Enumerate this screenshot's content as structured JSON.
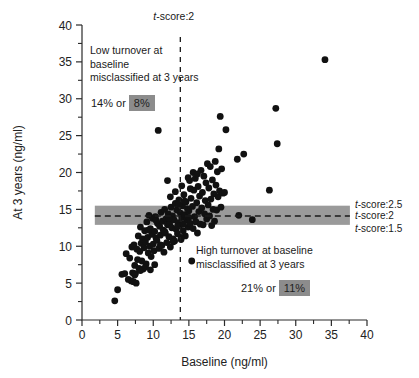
{
  "chart_data": {
    "type": "scatter",
    "title": "",
    "xlabel": "Baseline (ng/ml)",
    "ylabel": "At 3 years (ng/ml)",
    "xlim": [
      0,
      40
    ],
    "ylim": [
      0,
      40
    ],
    "xticks": [
      0,
      5,
      10,
      15,
      20,
      25,
      30,
      35,
      40
    ],
    "yticks": [
      0,
      5,
      10,
      15,
      20,
      25,
      30,
      35,
      40
    ],
    "xtick_labels": [
      "0",
      "5",
      "10",
      "15",
      "20",
      "25",
      "30",
      "35",
      "40"
    ],
    "ytick_labels": [
      "0",
      "5",
      "10",
      "15",
      "20",
      "25",
      "30",
      "35",
      "40"
    ],
    "minor_tick_step": 2.5,
    "grid": false,
    "legend": "none",
    "series": [
      {
        "name": "Bone turnover marker paired measurements",
        "marker": "circle",
        "color": "#111111",
        "points": [
          [
            4.6,
            2.6
          ],
          [
            5.0,
            4.1
          ],
          [
            5.6,
            6.2
          ],
          [
            6.0,
            6.3
          ],
          [
            6.2,
            9.0
          ],
          [
            6.5,
            5.5
          ],
          [
            6.7,
            8.4
          ],
          [
            6.9,
            5.3
          ],
          [
            7.0,
            9.9
          ],
          [
            7.1,
            6.4
          ],
          [
            7.2,
            5.2
          ],
          [
            7.3,
            10.2
          ],
          [
            7.4,
            7.4
          ],
          [
            7.5,
            6.3
          ],
          [
            7.6,
            5.0
          ],
          [
            7.7,
            9.6
          ],
          [
            7.8,
            8.2
          ],
          [
            7.9,
            11.4
          ],
          [
            8.0,
            7.0
          ],
          [
            8.1,
            9.3
          ],
          [
            8.2,
            12.6
          ],
          [
            8.3,
            10.4
          ],
          [
            8.4,
            8.0
          ],
          [
            8.5,
            11.0
          ],
          [
            8.6,
            6.9
          ],
          [
            8.7,
            9.8
          ],
          [
            8.8,
            12.1
          ],
          [
            8.9,
            10.6
          ],
          [
            9.0,
            7.6
          ],
          [
            9.1,
            13.3
          ],
          [
            9.2,
            11.2
          ],
          [
            9.3,
            9.1
          ],
          [
            9.4,
            14.2
          ],
          [
            9.5,
            10.0
          ],
          [
            9.6,
            12.4
          ],
          [
            9.7,
            8.6
          ],
          [
            9.8,
            11.6
          ],
          [
            9.9,
            13.8
          ],
          [
            10.0,
            10.3
          ],
          [
            10.1,
            9.4
          ],
          [
            10.2,
            12.0
          ],
          [
            10.3,
            14.0
          ],
          [
            10.4,
            11.1
          ],
          [
            10.5,
            10.8
          ],
          [
            10.6,
            13.1
          ],
          [
            10.7,
            25.7
          ],
          [
            10.8,
            9.7
          ],
          [
            10.9,
            12.7
          ],
          [
            11.0,
            11.5
          ],
          [
            11.1,
            14.6
          ],
          [
            11.2,
            10.1
          ],
          [
            11.3,
            13.4
          ],
          [
            11.4,
            12.2
          ],
          [
            11.5,
            9.2
          ],
          [
            11.6,
            15.0
          ],
          [
            11.7,
            11.8
          ],
          [
            11.8,
            13.7
          ],
          [
            11.9,
            10.5
          ],
          [
            12.0,
            12.9
          ],
          [
            12.1,
            14.4
          ],
          [
            12.2,
            11.3
          ],
          [
            12.3,
            13.0
          ],
          [
            12.4,
            9.9
          ],
          [
            12.5,
            15.3
          ],
          [
            12.6,
            12.5
          ],
          [
            12.7,
            14.1
          ],
          [
            12.8,
            11.0
          ],
          [
            12.9,
            13.6
          ],
          [
            13.0,
            10.7
          ],
          [
            13.1,
            15.8
          ],
          [
            13.2,
            12.3
          ],
          [
            13.3,
            14.9
          ],
          [
            13.4,
            11.7
          ],
          [
            13.5,
            13.2
          ],
          [
            13.6,
            16.3
          ],
          [
            13.7,
            12.8
          ],
          [
            13.8,
            14.5
          ],
          [
            13.9,
            10.9
          ],
          [
            14.0,
            13.9
          ],
          [
            14.1,
            15.5
          ],
          [
            14.2,
            12.1
          ],
          [
            14.3,
            17.0
          ],
          [
            14.4,
            14.3
          ],
          [
            14.5,
            11.4
          ],
          [
            14.6,
            16.0
          ],
          [
            14.7,
            13.5
          ],
          [
            14.8,
            15.1
          ],
          [
            14.9,
            12.6
          ],
          [
            15.0,
            14.8
          ],
          [
            15.1,
            18.9
          ],
          [
            15.2,
            13.1
          ],
          [
            15.3,
            16.5
          ],
          [
            15.4,
            8.0
          ],
          [
            15.5,
            15.4
          ],
          [
            15.6,
            12.4
          ],
          [
            15.7,
            17.6
          ],
          [
            15.8,
            14.0
          ],
          [
            15.9,
            19.2
          ],
          [
            16.0,
            13.3
          ],
          [
            16.1,
            15.9
          ],
          [
            16.2,
            11.8
          ],
          [
            16.3,
            18.1
          ],
          [
            16.4,
            14.7
          ],
          [
            16.5,
            16.8
          ],
          [
            16.6,
            13.0
          ],
          [
            16.7,
            20.3
          ],
          [
            16.8,
            15.2
          ],
          [
            16.9,
            17.3
          ],
          [
            17.0,
            12.9
          ],
          [
            17.1,
            19.5
          ],
          [
            17.2,
            14.4
          ],
          [
            17.3,
            16.2
          ],
          [
            17.4,
            18.6
          ],
          [
            17.5,
            13.7
          ],
          [
            17.6,
            21.2
          ],
          [
            17.7,
            15.6
          ],
          [
            17.8,
            17.9
          ],
          [
            17.9,
            14.1
          ],
          [
            18.0,
            20.8
          ],
          [
            18.1,
            16.4
          ],
          [
            18.2,
            12.8
          ],
          [
            18.3,
            19.0
          ],
          [
            18.4,
            15.0
          ],
          [
            18.5,
            17.1
          ],
          [
            18.6,
            13.4
          ],
          [
            18.7,
            21.5
          ],
          [
            18.8,
            18.3
          ],
          [
            18.9,
            14.9
          ],
          [
            19.0,
            20.1
          ],
          [
            19.1,
            16.7
          ],
          [
            19.2,
            23.2
          ],
          [
            19.3,
            17.5
          ],
          [
            19.4,
            27.6
          ],
          [
            19.5,
            15.3
          ],
          [
            19.6,
            20.5
          ],
          [
            19.8,
            17.2
          ],
          [
            20.0,
            17.3
          ],
          [
            20.2,
            25.8
          ],
          [
            21.8,
            21.8
          ],
          [
            22.0,
            14.2
          ],
          [
            22.7,
            22.5
          ],
          [
            23.9,
            13.6
          ],
          [
            26.3,
            17.6
          ],
          [
            27.2,
            28.7
          ],
          [
            27.4,
            23.9
          ],
          [
            34.1,
            35.3
          ],
          [
            9.3,
            12.2
          ],
          [
            10.4,
            13.5
          ],
          [
            11.6,
            12.0
          ],
          [
            12.2,
            13.8
          ],
          [
            13.4,
            12.7
          ],
          [
            14.2,
            13.0
          ],
          [
            15.0,
            13.9
          ],
          [
            11.0,
            10.2
          ],
          [
            12.8,
            10.6
          ],
          [
            13.9,
            11.2
          ],
          [
            8.2,
            6.7
          ],
          [
            8.9,
            7.2
          ],
          [
            9.6,
            6.8
          ],
          [
            10.2,
            7.5
          ],
          [
            7.4,
            6.1
          ],
          [
            12.4,
            16.7
          ],
          [
            13.1,
            17.4
          ],
          [
            14.0,
            18.2
          ],
          [
            14.9,
            19.3
          ],
          [
            12.0,
            18.9
          ],
          [
            15.6,
            20.0
          ],
          [
            16.2,
            19.8
          ],
          [
            13.6,
            15.7
          ],
          [
            14.4,
            16.1
          ],
          [
            15.2,
            17.8
          ]
        ]
      }
    ],
    "reference_lines": [
      {
        "name": "t-score:2 vertical",
        "orientation": "vertical",
        "value": 13.8,
        "style": "dashed"
      },
      {
        "name": "t-score:2 horizontal",
        "orientation": "horizontal",
        "value": 14.1,
        "style": "dashed"
      }
    ],
    "shaded_band": {
      "name": "t-score 1.5 to 2.5 band",
      "orientation": "horizontal",
      "y_low": 12.9,
      "y_high": 15.5,
      "x_start": 1.8,
      "x_end": 37.6,
      "color": "#9a9a9a"
    }
  },
  "annotations": {
    "top_line_label": {
      "name": "t-score-2-vertical-label",
      "prefix": "t",
      "suffix": "-score:2"
    },
    "right_labels": [
      {
        "name": "t-score-2.5-label",
        "prefix": "t",
        "suffix": "-score:2.5"
      },
      {
        "name": "t-score-2-label",
        "prefix": "t",
        "suffix": "-score:2"
      },
      {
        "name": "t-score-1.5-label",
        "prefix": "t",
        "suffix": "-score:1.5"
      }
    ],
    "upper_left": {
      "text": "Low turnover at\nbaseline\nmisclassified at 3 years",
      "percent_plain": "14% or",
      "percent_highlight": "8%"
    },
    "lower_right": {
      "text": "High turnover at baseline\nmisclassified at 3 years",
      "percent_plain": "21% or",
      "percent_highlight": "11%"
    }
  },
  "colors": {
    "point": "#111111",
    "band": "#9a9a9a",
    "highlight": "#8c8c8c",
    "axis": "#2b2b2b",
    "text": "#1a1a1a"
  }
}
